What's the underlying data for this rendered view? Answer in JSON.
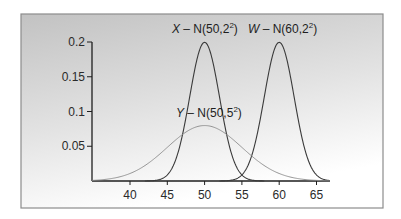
{
  "chart_data": {
    "type": "line",
    "title": "",
    "xlabel": "",
    "ylabel": "",
    "xlim": [
      34.9,
      66.8
    ],
    "ylim": [
      0,
      0.2
    ],
    "grid": false,
    "legend_position": "inline-labels",
    "x_ticks": [
      40,
      45,
      50,
      55,
      60,
      65
    ],
    "x_tick_labels": [
      "40",
      "45",
      "50",
      "55",
      "60",
      "65"
    ],
    "y_ticks": [
      0.05,
      0.1,
      0.15,
      0.2
    ],
    "y_tick_labels": [
      "0.05",
      "0.1",
      "0.15",
      "0.2"
    ],
    "series": [
      {
        "name": "X",
        "label_var": "X",
        "label_rest": " – N(50,2",
        "label_sup": "2",
        "label_close": ")",
        "distribution": "normal",
        "mean": 50,
        "sd": 2,
        "peak_density": 0.1995,
        "x_range": [
          42,
          58
        ],
        "color": "#3a3a3a",
        "stroke_width": 1.1
      },
      {
        "name": "W",
        "label_var": "W",
        "label_rest": " – N(60,2",
        "label_sup": "2",
        "label_close": ")",
        "distribution": "normal",
        "mean": 60,
        "sd": 2,
        "peak_density": 0.1995,
        "x_range": [
          52,
          66.8
        ],
        "color": "#3a3a3a",
        "stroke_width": 1.1
      },
      {
        "name": "Y",
        "label_var": "Y",
        "label_rest": " – N(50,5",
        "label_sup": "2",
        "label_close": ")",
        "distribution": "normal",
        "mean": 50,
        "sd": 5,
        "peak_density": 0.0798,
        "x_range": [
          34.9,
          66.8
        ],
        "color": "#8a8a8a",
        "stroke_width": 0.9
      }
    ],
    "annotations": [
      {
        "series": "X",
        "text": "X – N(50,2²)",
        "x_px": 172,
        "y_px": 33
      },
      {
        "series": "W",
        "text": "W – N(60,2²)",
        "x_px": 248,
        "y_px": 33
      },
      {
        "series": "Y",
        "text": "Y – N(50,5²)",
        "x_px": 176,
        "y_px": 117
      }
    ]
  },
  "layout": {
    "panel": {
      "x": 21,
      "y": 14,
      "w": 362,
      "h": 194
    },
    "plot": {
      "x0_px": 92,
      "x1_px": 330,
      "y0_px": 181,
      "ytop_px": 42,
      "x_ref_value": 40,
      "x_ref_px": 130,
      "px_per_x_unit": 7.46,
      "px_per_y_unit": 695
    },
    "colors": {
      "panel_top": "#c4c4c4",
      "panel_bottom": "#ffffff",
      "panel_border": "#8c8c8c",
      "axis": "#1e1e1e"
    }
  }
}
